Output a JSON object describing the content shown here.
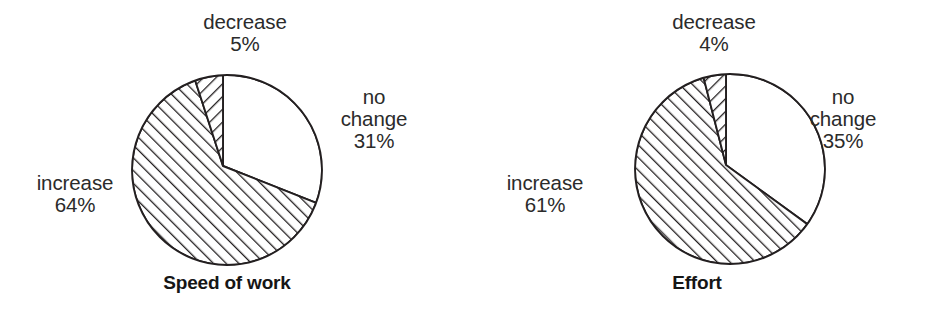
{
  "figure": {
    "background": "#ffffff",
    "stroke_color": "#231f20",
    "text_color": "#2b2b2b"
  },
  "chart_data": [
    {
      "type": "pie",
      "title": "Speed of work",
      "categories": [
        "no change",
        "increase",
        "decrease"
      ],
      "values": [
        31,
        64,
        5
      ],
      "labels": [
        "no change\n31%",
        "increase\n64%",
        "decrease\n5%"
      ],
      "units": "%",
      "start_angle_deg": 90,
      "direction": "clockwise",
      "slice_styles": [
        "blank",
        "hatch-forward",
        "hatch-backward"
      ],
      "legend": "none",
      "xlabel": "",
      "ylabel": ""
    },
    {
      "type": "pie",
      "title": "Effort",
      "categories": [
        "no change",
        "increase",
        "decrease"
      ],
      "values": [
        35,
        61,
        4
      ],
      "labels": [
        "no change\n35%",
        "increase\n61%",
        "decrease\n4%"
      ],
      "units": "%",
      "start_angle_deg": 90,
      "direction": "clockwise",
      "slice_styles": [
        "blank",
        "hatch-forward",
        "hatch-backward"
      ],
      "legend": "none",
      "xlabel": "",
      "ylabel": ""
    }
  ],
  "panels": [
    {
      "title": "Speed of work",
      "geometry": {
        "cx": 227,
        "cy": 170,
        "r": 95,
        "vx": 223,
        "vy": 166
      },
      "labels": {
        "decrease_name": "decrease",
        "decrease_value": "5%",
        "nochange_line1": "no",
        "nochange_line2": "change",
        "nochange_value": "31%",
        "increase_name": "increase",
        "increase_value": "64%"
      }
    },
    {
      "title": "Effort",
      "geometry": {
        "cx": 263,
        "cy": 169,
        "r": 95,
        "vx": 259,
        "vy": 165
      },
      "labels": {
        "decrease_name": "decrease",
        "decrease_value": "4%",
        "nochange_line1": "no",
        "nochange_line2": "change",
        "nochange_value": "35%",
        "increase_name": "increase",
        "increase_value": "61%"
      }
    }
  ]
}
